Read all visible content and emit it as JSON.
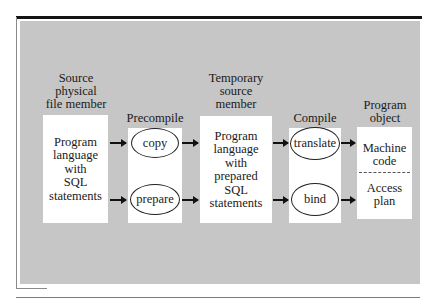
{
  "diagram": {
    "stages": [
      {
        "id": "source",
        "heading": [
          "Source",
          "physical",
          "file member"
        ],
        "content": [
          "Program",
          "language",
          "with",
          "SQL",
          "statements"
        ]
      },
      {
        "id": "precompile",
        "heading": [
          "Precompile"
        ],
        "processes": [
          "copy",
          "prepare"
        ]
      },
      {
        "id": "temporary",
        "heading": [
          "Temporary",
          "source",
          "member"
        ],
        "content": [
          "Program",
          "language",
          "with",
          "prepared",
          "SQL",
          "statements"
        ]
      },
      {
        "id": "compile",
        "heading": [
          "Compile"
        ],
        "processes": [
          "translate",
          "bind"
        ]
      },
      {
        "id": "program-object",
        "heading": [
          "Program",
          "object"
        ],
        "sections": [
          [
            "Machine",
            "code"
          ],
          [
            "Access",
            "plan"
          ]
        ]
      }
    ],
    "flows": [
      {
        "from": "source",
        "to": "copy"
      },
      {
        "from": "source",
        "to": "prepare"
      },
      {
        "from": "copy",
        "to": "temporary"
      },
      {
        "from": "prepare",
        "to": "temporary"
      },
      {
        "from": "temporary",
        "to": "translate"
      },
      {
        "from": "temporary",
        "to": "bind"
      },
      {
        "from": "translate",
        "to": "machine-code"
      },
      {
        "from": "bind",
        "to": "access-plan"
      }
    ],
    "colors": {
      "panel": "#c6c6c6",
      "box": "#ffffff",
      "text": "#1a1a1a",
      "rule": "#141414"
    }
  }
}
